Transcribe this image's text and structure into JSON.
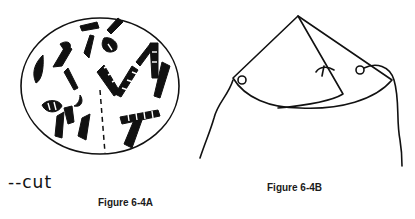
{
  "figures": [
    {
      "id": "6-4A",
      "caption": "Figure 6-4A",
      "description": "Paper circle decorated with shapes, with a dashed cut line from center to edge",
      "legend": {
        "label": "--cut",
        "meaning": "dashed line indicates cut"
      }
    },
    {
      "id": "6-4B",
      "caption": "Figure 6-4B",
      "description": "Circle rolled into a cone with string loops attached at both sides"
    }
  ],
  "colors": {
    "ink": "#111111",
    "background": "#ffffff"
  }
}
